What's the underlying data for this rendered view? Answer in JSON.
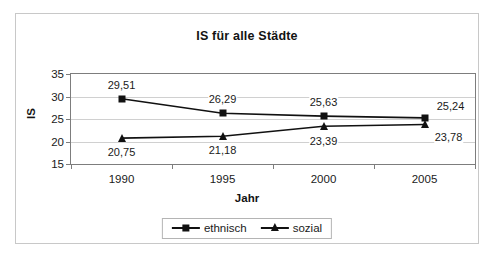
{
  "chart_data": {
    "type": "line",
    "title": "IS für alle Städte",
    "xlabel": "Jahr",
    "ylabel": "IS",
    "categories": [
      "1990",
      "1995",
      "2000",
      "2005"
    ],
    "x": [
      1990,
      1995,
      2000,
      2005
    ],
    "ylim": [
      15,
      35
    ],
    "yticks": [
      "15",
      "20",
      "25",
      "30",
      "35"
    ],
    "ytick_values": [
      15,
      20,
      25,
      30,
      35
    ],
    "grid": true,
    "legend_position": "bottom",
    "series": [
      {
        "name": "ethnisch",
        "marker": "square",
        "color": "#111111",
        "values": [
          29.51,
          26.29,
          25.63,
          25.24
        ],
        "labels": [
          "29,51",
          "26,29",
          "25,63",
          "25,24"
        ]
      },
      {
        "name": "sozial",
        "marker": "triangle",
        "color": "#111111",
        "values": [
          20.75,
          21.18,
          23.39,
          23.78
        ],
        "labels": [
          "20,75",
          "21,18",
          "23,39",
          "23,78"
        ]
      }
    ]
  }
}
